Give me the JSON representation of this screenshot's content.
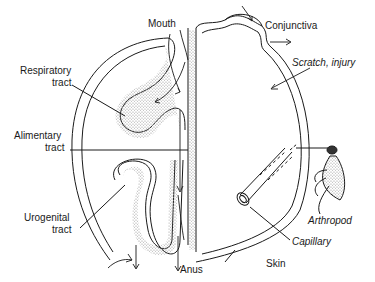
{
  "diagram": {
    "labels": {
      "mouth": "Mouth",
      "conjunctiva": "Conjunctiva",
      "scratch": "Scratch, injury",
      "respiratory_1": "Respiratory",
      "respiratory_2": "tract",
      "alimentary_1": "Alimentary",
      "alimentary_2": "tract",
      "urogenital_1": "Urogenital",
      "urogenital_2": "tract",
      "anus": "Anus",
      "skin": "Skin",
      "capillary": "Capillary",
      "arthropod": "Arthropod"
    },
    "colors": {
      "line": "#1a1a1a",
      "stipple": "#9a9a9a",
      "background": "#ffffff"
    }
  }
}
